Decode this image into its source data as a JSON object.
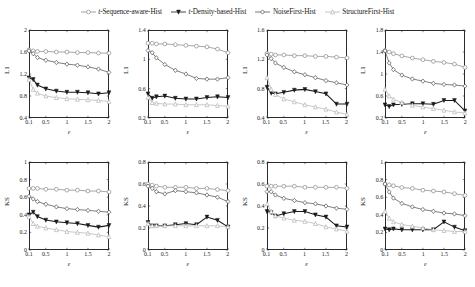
{
  "legend": {
    "position": "top-center",
    "entries": [
      {
        "label": "t-Sequence-aware-Hist",
        "italic_prefix": "t-",
        "rest": "Sequence-aware-Hist",
        "marker": "circle-open",
        "color": "#8a8a8a",
        "linestyle": "solid"
      },
      {
        "label": "t-Density-based-Hist",
        "italic_prefix": "t-",
        "rest": "Density-based-Hist",
        "marker": "triangle-down-filled",
        "color": "#1a1a1a",
        "linestyle": "solid"
      },
      {
        "label": "NoiseFirst-Hist",
        "italic_prefix": "",
        "rest": "NoiseFirst-Hist",
        "marker": "diamond-open",
        "color": "#555555",
        "linestyle": "solid"
      },
      {
        "label": "StructureFirst-Hist",
        "italic_prefix": "",
        "rest": "StructureFirst-Hist",
        "marker": "triangle-up-open",
        "color": "#b5b5b5",
        "linestyle": "solid"
      }
    ]
  },
  "colors": {
    "seq_aware": "#8a8a8a",
    "density_based": "#1a1a1a",
    "noise_first": "#555555",
    "structure_first": "#b5b5b5",
    "axis": "#2b2b2b",
    "background": "#ffffff"
  },
  "chart_data": [
    {
      "type": "line",
      "title": "USairport L1",
      "xlabel": "ε",
      "ylabel": "L1",
      "x": [
        0.1,
        0.2,
        0.3,
        0.5,
        0.75,
        1,
        1.25,
        1.5,
        1.75,
        2
      ],
      "xlim": [
        0.1,
        2
      ],
      "ylim": [
        0.4,
        2
      ],
      "xticks": [
        0.1,
        0.5,
        1,
        1.5,
        2
      ],
      "yticks": [
        0.4,
        0.8,
        1.2,
        1.6,
        2
      ],
      "grid": false,
      "series": [
        {
          "name": "t-Sequence-aware-Hist",
          "values": [
            1.64,
            1.62,
            1.61,
            1.61,
            1.6,
            1.6,
            1.59,
            1.59,
            1.58,
            1.58
          ]
        },
        {
          "name": "t-Density-based-Hist",
          "values": [
            1.13,
            1.1,
            1.0,
            0.93,
            0.89,
            0.87,
            0.87,
            0.86,
            0.84,
            0.86
          ]
        },
        {
          "name": "NoiseFirst-Hist",
          "values": [
            1.62,
            1.57,
            1.5,
            1.45,
            1.41,
            1.38,
            1.36,
            1.33,
            1.29,
            1.23
          ]
        },
        {
          "name": "StructureFirst-Hist",
          "values": [
            1.1,
            0.92,
            0.85,
            0.8,
            0.77,
            0.75,
            0.74,
            0.73,
            0.72,
            0.7
          ]
        }
      ]
    },
    {
      "type": "line",
      "title": "Facebook L1",
      "xlabel": "ε",
      "ylabel": "L1",
      "x": [
        0.1,
        0.2,
        0.3,
        0.5,
        0.75,
        1,
        1.25,
        1.5,
        1.75,
        2
      ],
      "xlim": [
        0.1,
        2
      ],
      "ylim": [
        0.2,
        1.4
      ],
      "xticks": [
        0.1,
        0.5,
        1,
        1.5,
        2
      ],
      "yticks": [
        0.2,
        0.6,
        1.0,
        1.4
      ],
      "grid": false,
      "series": [
        {
          "name": "t-Sequence-aware-Hist",
          "values": [
            1.22,
            1.22,
            1.21,
            1.21,
            1.2,
            1.19,
            1.18,
            1.17,
            1.14,
            1.09
          ]
        },
        {
          "name": "t-Density-based-Hist",
          "values": [
            0.53,
            0.47,
            0.49,
            0.5,
            0.47,
            0.46,
            0.46,
            0.48,
            0.49,
            0.48
          ]
        },
        {
          "name": "NoiseFirst-Hist",
          "values": [
            1.12,
            1.09,
            1.02,
            0.93,
            0.85,
            0.8,
            0.74,
            0.73,
            0.73,
            0.75
          ]
        },
        {
          "name": "StructureFirst-Hist",
          "values": [
            0.48,
            0.41,
            0.4,
            0.39,
            0.39,
            0.38,
            0.38,
            0.38,
            0.37,
            0.36
          ]
        }
      ]
    },
    {
      "type": "line",
      "title": "Bitcoin L1",
      "xlabel": "ε",
      "ylabel": "L1",
      "x": [
        0.1,
        0.2,
        0.3,
        0.5,
        0.75,
        1,
        1.25,
        1.5,
        1.75,
        2
      ],
      "xlim": [
        0.1,
        2
      ],
      "ylim": [
        0.4,
        1.6
      ],
      "xticks": [
        0.1,
        0.5,
        1,
        1.5,
        2
      ],
      "yticks": [
        0.4,
        0.8,
        1.2,
        1.6
      ],
      "grid": false,
      "series": [
        {
          "name": "t-Sequence-aware-Hist",
          "values": [
            1.28,
            1.27,
            1.26,
            1.26,
            1.25,
            1.25,
            1.24,
            1.24,
            1.23,
            1.22
          ]
        },
        {
          "name": "t-Density-based-Hist",
          "values": [
            0.82,
            0.74,
            0.73,
            0.75,
            0.78,
            0.79,
            0.76,
            0.73,
            0.59,
            0.59
          ]
        },
        {
          "name": "NoiseFirst-Hist",
          "values": [
            1.26,
            1.21,
            1.15,
            1.09,
            1.03,
            0.99,
            0.95,
            0.91,
            0.88,
            0.85
          ]
        },
        {
          "name": "StructureFirst-Hist",
          "values": [
            0.95,
            0.79,
            0.72,
            0.66,
            0.62,
            0.58,
            0.55,
            0.52,
            0.48,
            0.45
          ]
        }
      ]
    },
    {
      "type": "line",
      "title": "Enron L1",
      "xlabel": "ε",
      "ylabel": "L1",
      "x": [
        0.1,
        0.2,
        0.3,
        0.5,
        0.75,
        1,
        1.25,
        1.5,
        1.75,
        2
      ],
      "xlim": [
        0.1,
        2
      ],
      "ylim": [
        0.2,
        1.8
      ],
      "xticks": [
        0.1,
        0.5,
        1,
        1.5,
        2
      ],
      "yticks": [
        0.2,
        0.6,
        1.0,
        1.4,
        1.8
      ],
      "grid": false,
      "series": [
        {
          "name": "t-Sequence-aware-Hist",
          "values": [
            1.43,
            1.4,
            1.37,
            1.33,
            1.29,
            1.26,
            1.23,
            1.21,
            1.18,
            1.12
          ]
        },
        {
          "name": "t-Density-based-Hist",
          "values": [
            0.44,
            0.41,
            0.44,
            0.45,
            0.46,
            0.46,
            0.45,
            0.52,
            0.52,
            0.33
          ]
        },
        {
          "name": "NoiseFirst-Hist",
          "values": [
            1.42,
            1.2,
            1.08,
            0.98,
            0.91,
            0.87,
            0.83,
            0.81,
            0.8,
            0.78
          ]
        },
        {
          "name": "StructureFirst-Hist",
          "values": [
            0.72,
            0.6,
            0.54,
            0.48,
            0.43,
            0.4,
            0.37,
            0.34,
            0.31,
            0.29
          ]
        }
      ]
    },
    {
      "type": "line",
      "title": "USairport KS",
      "xlabel": "ε",
      "ylabel": "KS",
      "x": [
        0.1,
        0.2,
        0.3,
        0.5,
        0.75,
        1,
        1.25,
        1.5,
        1.75,
        2
      ],
      "xlim": [
        0.1,
        2
      ],
      "ylim": [
        0,
        1
      ],
      "xticks": [
        0.1,
        0.5,
        1,
        1.5,
        2
      ],
      "yticks": [
        0,
        0.2,
        0.4,
        0.6,
        0.8,
        1
      ],
      "grid": false,
      "series": [
        {
          "name": "t-Sequence-aware-Hist",
          "values": [
            0.7,
            0.7,
            0.7,
            0.69,
            0.69,
            0.68,
            0.68,
            0.67,
            0.67,
            0.66
          ]
        },
        {
          "name": "t-Density-based-Hist",
          "values": [
            0.4,
            0.43,
            0.38,
            0.34,
            0.32,
            0.31,
            0.3,
            0.28,
            0.26,
            0.28
          ]
        },
        {
          "name": "NoiseFirst-Hist",
          "values": [
            0.61,
            0.58,
            0.55,
            0.52,
            0.49,
            0.47,
            0.46,
            0.45,
            0.44,
            0.43
          ]
        },
        {
          "name": "StructureFirst-Hist",
          "values": [
            0.38,
            0.3,
            0.27,
            0.25,
            0.23,
            0.21,
            0.2,
            0.19,
            0.17,
            0.15
          ]
        }
      ]
    },
    {
      "type": "line",
      "title": "Facebook KS",
      "xlabel": "ε",
      "ylabel": "KS",
      "x": [
        0.1,
        0.2,
        0.3,
        0.5,
        0.75,
        1,
        1.25,
        1.5,
        1.75,
        2
      ],
      "xlim": [
        0.1,
        2
      ],
      "ylim": [
        0,
        0.8
      ],
      "xticks": [
        0.1,
        0.5,
        1,
        1.5,
        2
      ],
      "yticks": [
        0,
        0.2,
        0.4,
        0.6,
        0.8
      ],
      "grid": false,
      "series": [
        {
          "name": "t-Sequence-aware-Hist",
          "values": [
            0.6,
            0.59,
            0.58,
            0.57,
            0.57,
            0.57,
            0.56,
            0.56,
            0.55,
            0.54
          ]
        },
        {
          "name": "t-Density-based-Hist",
          "values": [
            0.25,
            0.22,
            0.22,
            0.22,
            0.23,
            0.24,
            0.23,
            0.3,
            0.27,
            0.21
          ]
        },
        {
          "name": "NoiseFirst-Hist",
          "values": [
            0.58,
            0.56,
            0.53,
            0.51,
            0.54,
            0.53,
            0.52,
            0.5,
            0.48,
            0.44
          ]
        },
        {
          "name": "StructureFirst-Hist",
          "values": [
            0.24,
            0.22,
            0.22,
            0.22,
            0.22,
            0.22,
            0.22,
            0.22,
            0.22,
            0.21
          ]
        }
      ]
    },
    {
      "type": "line",
      "title": "Bitcoin KS",
      "xlabel": "ε",
      "ylabel": "KS",
      "x": [
        0.1,
        0.2,
        0.3,
        0.5,
        0.75,
        1,
        1.25,
        1.5,
        1.75,
        2
      ],
      "xlim": [
        0.1,
        2
      ],
      "ylim": [
        0,
        0.8
      ],
      "xticks": [
        0.1,
        0.5,
        1,
        1.5,
        2
      ],
      "yticks": [
        0,
        0.2,
        0.4,
        0.6,
        0.8
      ],
      "grid": false,
      "series": [
        {
          "name": "t-Sequence-aware-Hist",
          "values": [
            0.58,
            0.58,
            0.58,
            0.58,
            0.58,
            0.57,
            0.57,
            0.57,
            0.57,
            0.56
          ]
        },
        {
          "name": "t-Density-based-Hist",
          "values": [
            0.35,
            0.34,
            0.31,
            0.33,
            0.35,
            0.35,
            0.32,
            0.3,
            0.22,
            0.21
          ]
        },
        {
          "name": "NoiseFirst-Hist",
          "values": [
            0.53,
            0.53,
            0.5,
            0.47,
            0.45,
            0.43,
            0.42,
            0.4,
            0.38,
            0.37
          ]
        },
        {
          "name": "StructureFirst-Hist",
          "values": [
            0.42,
            0.35,
            0.31,
            0.29,
            0.27,
            0.26,
            0.24,
            0.21,
            0.19,
            0.17
          ]
        }
      ]
    },
    {
      "type": "line",
      "title": "Enron KS",
      "xlabel": "ε",
      "ylabel": "KS",
      "x": [
        0.1,
        0.2,
        0.3,
        0.5,
        0.75,
        1,
        1.25,
        1.5,
        1.75,
        2
      ],
      "xlim": [
        0.1,
        2
      ],
      "ylim": [
        0,
        1
      ],
      "xticks": [
        0.1,
        0.5,
        1,
        1.5,
        2
      ],
      "yticks": [
        0,
        0.2,
        0.4,
        0.6,
        0.8,
        1
      ],
      "grid": false,
      "series": [
        {
          "name": "t-Sequence-aware-Hist",
          "values": [
            0.75,
            0.74,
            0.73,
            0.71,
            0.7,
            0.68,
            0.67,
            0.66,
            0.64,
            0.62
          ]
        },
        {
          "name": "t-Density-based-Hist",
          "values": [
            0.24,
            0.23,
            0.24,
            0.23,
            0.23,
            0.23,
            0.23,
            0.32,
            0.26,
            0.22
          ]
        },
        {
          "name": "NoiseFirst-Hist",
          "values": [
            0.75,
            0.66,
            0.59,
            0.53,
            0.49,
            0.46,
            0.44,
            0.42,
            0.41,
            0.39
          ]
        },
        {
          "name": "StructureFirst-Hist",
          "values": [
            0.44,
            0.36,
            0.32,
            0.29,
            0.27,
            0.25,
            0.23,
            0.22,
            0.21,
            0.21
          ]
        }
      ]
    }
  ]
}
